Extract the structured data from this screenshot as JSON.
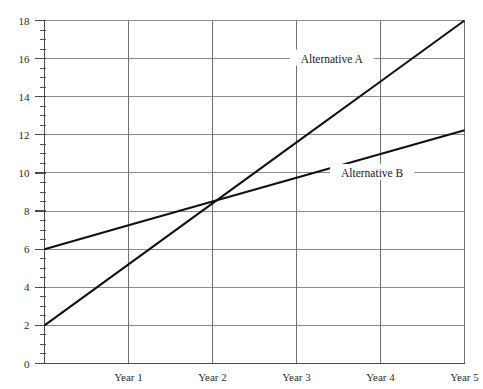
{
  "chart_data": {
    "type": "line",
    "title": "",
    "subtitle": "",
    "xlabel": "",
    "ylabel": "",
    "x": [
      "Year 0",
      "Year 1",
      "Year 2",
      "Year 3",
      "Year 4",
      "Year 5"
    ],
    "x_tick_labels": [
      "Year 1",
      "Year 2",
      "Year 3",
      "Year 4",
      "Year 5"
    ],
    "y_tick_labels": [
      "0",
      "2",
      "4",
      "6",
      "8",
      "10",
      "12",
      "14",
      "16",
      "18"
    ],
    "y_tick_values": [
      0,
      2,
      4,
      6,
      8,
      10,
      12,
      14,
      16,
      18
    ],
    "ylim": [
      0,
      18
    ],
    "xlim": [
      0,
      5
    ],
    "y_minor_tick_step": 0.5,
    "grid": "horizontal-and-vertical",
    "legend_position": "inline-annotation",
    "series": [
      {
        "name": "Alternative A",
        "label": "Alternative A",
        "color": "#111111",
        "x": [
          0,
          1,
          2,
          3,
          4,
          5
        ],
        "values": [
          2.0,
          5.2,
          8.4,
          11.6,
          14.8,
          18.0
        ],
        "label_x": 3.42,
        "label_y": 16.0
      },
      {
        "name": "Alternative B",
        "label": "Alternative B",
        "color": "#111111",
        "x": [
          0,
          1,
          2,
          3,
          4,
          5
        ],
        "values": [
          6.0,
          7.25,
          8.5,
          9.75,
          11.0,
          12.24
        ],
        "label_x": 3.9,
        "label_y": 10.0
      }
    ],
    "annotations": [
      {
        "text": "Alternative A",
        "x": 3.42,
        "y": 16.0
      },
      {
        "text": "Alternative B",
        "x": 3.9,
        "y": 10.0
      }
    ],
    "crossover": {
      "x": 2,
      "y": 8.5
    }
  }
}
